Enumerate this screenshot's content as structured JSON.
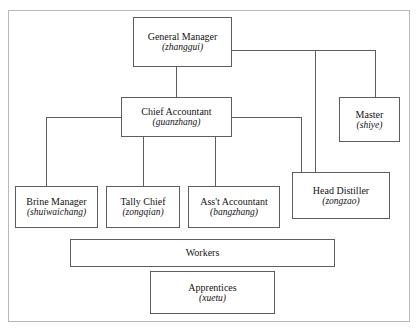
{
  "diagram": {
    "type": "organizational-chart",
    "nodes": [
      {
        "id": "general-manager",
        "title": "General Manager",
        "pinyin": "(zhanggui)",
        "level": 0
      },
      {
        "id": "chief-accountant",
        "title": "Chief Accountant",
        "pinyin": "(guanzhang)",
        "level": 1
      },
      {
        "id": "master",
        "title": "Master",
        "pinyin": "(shiye)",
        "level": 1
      },
      {
        "id": "head-distiller",
        "title": "Head Distiller",
        "pinyin": "(zongzao)",
        "level": 2
      },
      {
        "id": "brine-manager",
        "title": "Brine Manager",
        "pinyin": "(shuiwaichang)",
        "level": 2
      },
      {
        "id": "tally-chief",
        "title": "Tally Chief",
        "pinyin": "(zongqian)",
        "level": 2
      },
      {
        "id": "asst-accountant",
        "title": "Ass't Accountant",
        "pinyin": "(bangzhang)",
        "level": 2
      },
      {
        "id": "workers",
        "title": "Workers",
        "pinyin": "",
        "level": 3
      },
      {
        "id": "apprentices",
        "title": "Apprentices",
        "pinyin": "(xuetu)",
        "level": 4
      }
    ],
    "edges": [
      {
        "from": "general-manager",
        "to": "chief-accountant"
      },
      {
        "from": "general-manager",
        "to": "master"
      },
      {
        "from": "general-manager",
        "to": "head-distiller"
      },
      {
        "from": "chief-accountant",
        "to": "head-distiller"
      },
      {
        "from": "chief-accountant",
        "to": "brine-manager"
      },
      {
        "from": "chief-accountant",
        "to": "tally-chief"
      },
      {
        "from": "chief-accountant",
        "to": "asst-accountant"
      }
    ],
    "colors": {
      "box_border": "#5d5d5d",
      "connector": "#5d5d5d",
      "frame": "#b9b9b9",
      "background": "#ffffff",
      "text": "#141414"
    }
  }
}
